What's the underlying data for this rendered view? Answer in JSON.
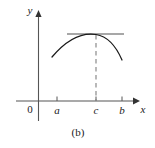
{
  "figure": {
    "caption": "(b)",
    "background_color": "#ffffff",
    "axes": {
      "x_axis_label": "x",
      "y_axis_label": "y",
      "origin_label": "0",
      "axis_color": "#555555",
      "x_axis_y": 101,
      "y_axis_x": 38.5
    },
    "ticks": [
      {
        "label": "a",
        "x": 57
      },
      {
        "label": "c",
        "x": 96
      },
      {
        "label": "b",
        "x": 122
      }
    ],
    "curve": {
      "name": "function-curve",
      "color": "#1a1a1a",
      "path": "M 52 57 Q 74 31 96 34.5 Q 112 37 122 60",
      "description": "concave-down arc with maximum at c"
    },
    "tangent_line": {
      "name": "horizontal-tangent-line",
      "color": "#8a8a8a",
      "x_start": 67,
      "x_end": 124,
      "y": 34
    },
    "dashed_line": {
      "name": "vertical-dashed-line-at-c",
      "color": "#8a8a8a",
      "x": 96,
      "y_start": 35,
      "y_end": 101
    }
  }
}
